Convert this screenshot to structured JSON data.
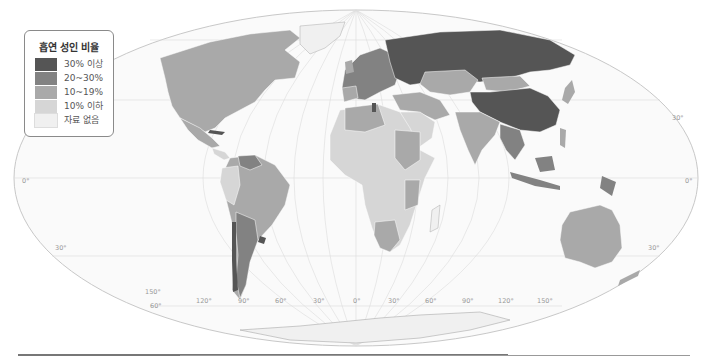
{
  "legend": {
    "title": "흡연 성인 비율",
    "items": [
      {
        "label": "30% 이상",
        "color": "#555555"
      },
      {
        "label": "20~30%",
        "color": "#828282"
      },
      {
        "label": "10~19%",
        "color": "#a9a9a9"
      },
      {
        "label": "10% 이하",
        "color": "#d6d6d6"
      },
      {
        "label": "자료 없음",
        "color": "#f0f0f0"
      }
    ]
  },
  "map": {
    "projection": "Mollweide-like world map",
    "latitude_labels": {
      "equator_left": "0°",
      "equator_right": "0°",
      "north30_right": "30°",
      "south30_left": "30°",
      "south30_right": "30°",
      "south60": "60°"
    },
    "longitude_labels": [
      "150°",
      "120°",
      "90°",
      "60°",
      "30°",
      "0°",
      "30°",
      "60°",
      "90°",
      "120°",
      "150°"
    ],
    "ocean_color": "#fafafa",
    "grid_color": "#d8d8d8"
  }
}
